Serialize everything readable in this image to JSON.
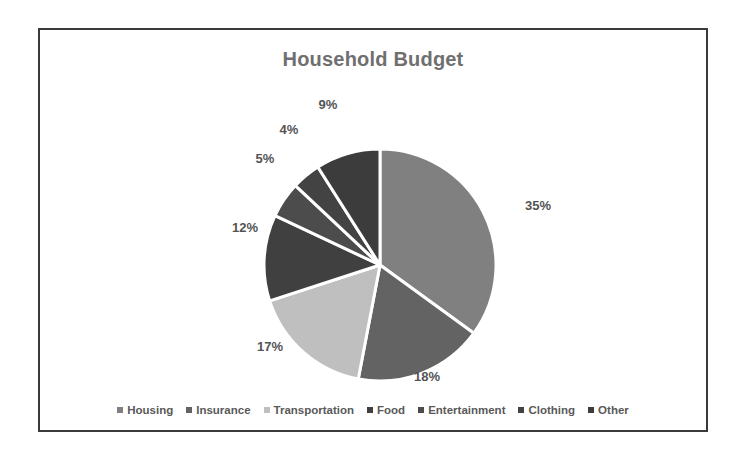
{
  "chart_data": {
    "type": "pie",
    "title": "Household Budget",
    "xlabel": "",
    "ylabel": "",
    "legend_position": "bottom",
    "grid": false,
    "categories": [
      "Housing",
      "Insurance",
      "Transportation",
      "Food",
      "Entertainment",
      "Clothing",
      "Other"
    ],
    "values": [
      35,
      18,
      17,
      12,
      5,
      4,
      9
    ],
    "data_labels": [
      "35%",
      "18%",
      "17%",
      "12%",
      "5%",
      "4%",
      "9%"
    ],
    "colors": [
      "#808080",
      "#636363",
      "#bfbfbf",
      "#404040",
      "#4c4c4c",
      "#434343",
      "#3c3c3c"
    ],
    "slice_separator_color": "#ffffff",
    "start_angle_deg": 0,
    "direction": "clockwise"
  },
  "chart": {
    "title": "Household Budget",
    "title_color": "#6f6f6f",
    "frame_border_color": "#3a3a3a",
    "background": "#ffffff"
  },
  "slices": [
    {
      "name": "Housing",
      "label": "35%",
      "value": 35,
      "color": "#808080",
      "label_x": 498,
      "label_y": 175
    },
    {
      "name": "Insurance",
      "label": "18%",
      "value": 18,
      "color": "#636363",
      "label_x": 387,
      "label_y": 346
    },
    {
      "name": "Transportation",
      "label": "17%",
      "value": 17,
      "color": "#bfbfbf",
      "label_x": 230,
      "label_y": 316
    },
    {
      "name": "Food",
      "label": "12%",
      "value": 12,
      "color": "#404040",
      "label_x": 205,
      "label_y": 197
    },
    {
      "name": "Entertainment",
      "label": "5%",
      "value": 5,
      "color": "#4c4c4c",
      "label_x": 225,
      "label_y": 128
    },
    {
      "name": "Clothing",
      "label": "4%",
      "value": 4,
      "color": "#434343",
      "label_x": 249,
      "label_y": 99
    },
    {
      "name": "Other",
      "label": "9%",
      "value": 9,
      "color": "#3c3c3c",
      "label_x": 288,
      "label_y": 74
    }
  ],
  "legend": {
    "items": [
      {
        "label": "Housing",
        "color": "#808080"
      },
      {
        "label": "Insurance",
        "color": "#636363"
      },
      {
        "label": "Transportation",
        "color": "#bfbfbf"
      },
      {
        "label": "Food",
        "color": "#404040"
      },
      {
        "label": "Entertainment",
        "color": "#4c4c4c"
      },
      {
        "label": "Clothing",
        "color": "#434343"
      },
      {
        "label": "Other",
        "color": "#3c3c3c"
      }
    ]
  }
}
